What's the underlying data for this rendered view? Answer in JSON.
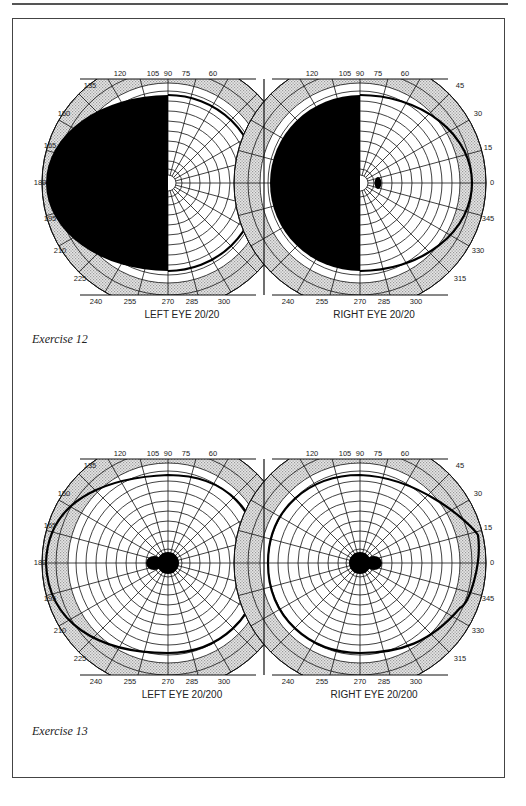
{
  "exercises": [
    {
      "caption": "Exercise 12",
      "charts": [
        {
          "eye": "left",
          "label": "LEFT EYE",
          "acuity": "20/20",
          "defect": "left-hemianopia-left-eye",
          "blind_spot": "none-visible"
        },
        {
          "eye": "right",
          "label": "RIGHT EYE",
          "acuity": "20/20",
          "defect": "left-hemianopia-right-eye",
          "blind_spot": "small-oval-temporal"
        }
      ]
    },
    {
      "caption": "Exercise 13",
      "charts": [
        {
          "eye": "left",
          "label": "LEFT EYE",
          "acuity": "20/200",
          "defect": "central-scotoma-with-blind-spot",
          "blind_spot": "merged-central"
        },
        {
          "eye": "right",
          "label": "RIGHT EYE",
          "acuity": "20/200",
          "defect": "central-scotoma-with-blind-spot",
          "blind_spot": "merged-central"
        }
      ]
    }
  ],
  "angle_ticks": {
    "left_eye": [
      "120",
      "105",
      "90",
      "75",
      "60",
      "135",
      "150",
      "165",
      "180",
      "195",
      "210",
      "225",
      "240",
      "255",
      "270",
      "285",
      "300"
    ],
    "right_eye": [
      "120",
      "105",
      "90",
      "75",
      "60",
      "45",
      "30",
      "15",
      "0",
      "345",
      "330",
      "315",
      "240",
      "255",
      "270",
      "285",
      "300"
    ]
  },
  "colors": {
    "ink": "#111111",
    "shade": "#d4d4d4",
    "paper": "#ffffff",
    "frame": "#444444"
  }
}
